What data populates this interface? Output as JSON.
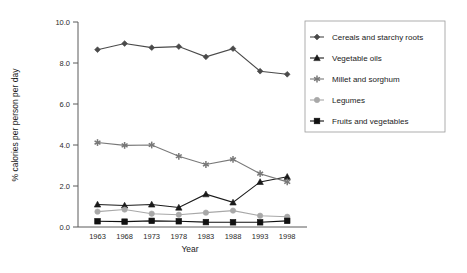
{
  "chart_data": {
    "type": "line",
    "title": "",
    "subtitle": "",
    "xlabel": "Year",
    "ylabel": "% calories per person per day",
    "categories": [
      "1963",
      "1968",
      "1973",
      "1978",
      "1983",
      "1988",
      "1993",
      "1998"
    ],
    "x": [
      1963,
      1968,
      1973,
      1978,
      1983,
      1988,
      1993,
      1998
    ],
    "xlim": [
      1963,
      1998
    ],
    "ylim": [
      0.0,
      10.0
    ],
    "yticks": [
      "0.0",
      "2.0",
      "4.0",
      "6.0",
      "8.0",
      "10.0"
    ],
    "ytick_values": [
      0.0,
      2.0,
      4.0,
      6.0,
      8.0,
      10.0
    ],
    "grid": false,
    "legend_position": "right",
    "series": [
      {
        "name": "Cereals and starchy roots",
        "marker": "diamond",
        "color": "#4a4a4a",
        "values": [
          8.65,
          8.95,
          8.75,
          8.8,
          8.3,
          8.7,
          7.6,
          7.45
        ]
      },
      {
        "name": "Vegetable oils",
        "marker": "triangle",
        "color": "#1a1a1a",
        "values": [
          1.1,
          1.05,
          1.1,
          0.95,
          1.6,
          1.2,
          2.2,
          2.45
        ]
      },
      {
        "name": "Millet and sorghum",
        "marker": "star",
        "color": "#787878",
        "values": [
          4.12,
          3.98,
          4.0,
          3.45,
          3.05,
          3.3,
          2.6,
          2.2
        ]
      },
      {
        "name": "Legumes",
        "marker": "circle",
        "color": "#a8a8a8",
        "values": [
          0.75,
          0.85,
          0.65,
          0.6,
          0.7,
          0.8,
          0.55,
          0.5
        ]
      },
      {
        "name": "Fruits and vegetables",
        "marker": "square",
        "color": "#111111",
        "values": [
          0.28,
          0.26,
          0.3,
          0.28,
          0.24,
          0.23,
          0.23,
          0.3
        ]
      }
    ]
  },
  "axes": {
    "y_title": "% calories per person per day",
    "x_title": "Year",
    "y_tick_labels": [
      "10.0",
      "8.0",
      "6.0",
      "4.0",
      "2.0",
      "0.0"
    ],
    "x_tick_labels": [
      "1963",
      "1968",
      "1973",
      "1978",
      "1983",
      "1988",
      "1993",
      "1998"
    ]
  },
  "legend": {
    "items": [
      {
        "label": "Cereals and starchy roots",
        "marker": "diamond",
        "color": "#4a4a4a"
      },
      {
        "label": "Vegetable oils",
        "marker": "triangle",
        "color": "#1a1a1a"
      },
      {
        "label": "Millet and sorghum",
        "marker": "star",
        "color": "#787878"
      },
      {
        "label": "Legumes",
        "marker": "circle",
        "color": "#a8a8a8"
      },
      {
        "label": "Fruits and vegetables",
        "marker": "square",
        "color": "#111111"
      }
    ]
  },
  "colors": {
    "background": "#ffffff",
    "axis": "#5a5a5a",
    "text": "#1a1a1a"
  }
}
